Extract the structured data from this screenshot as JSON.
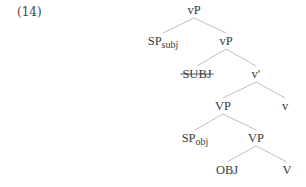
{
  "example_number": "(14)",
  "tree": {
    "nodes": [
      {
        "id": "vP_root",
        "label": "vP",
        "sub": ""
      },
      {
        "id": "SP_subj",
        "label": "SP",
        "sub": "subj"
      },
      {
        "id": "vP_2",
        "label": "vP",
        "sub": ""
      },
      {
        "id": "SUBJ",
        "label": "SUBJ",
        "sub": "",
        "struck": true
      },
      {
        "id": "v_bar",
        "label": "v′",
        "sub": ""
      },
      {
        "id": "VP_1",
        "label": "VP",
        "sub": ""
      },
      {
        "id": "v_head",
        "label": "v",
        "sub": ""
      },
      {
        "id": "SP_obj",
        "label": "SP",
        "sub": "obj"
      },
      {
        "id": "VP_2",
        "label": "VP",
        "sub": ""
      },
      {
        "id": "OBJ",
        "label": "OBJ",
        "sub": ""
      },
      {
        "id": "V_head",
        "label": "V",
        "sub": ""
      }
    ],
    "edges": [
      [
        "vP_root",
        "SP_subj"
      ],
      [
        "vP_root",
        "vP_2"
      ],
      [
        "vP_2",
        "SUBJ"
      ],
      [
        "vP_2",
        "v_bar"
      ],
      [
        "v_bar",
        "VP_1"
      ],
      [
        "v_bar",
        "v_head"
      ],
      [
        "VP_1",
        "SP_obj"
      ],
      [
        "VP_1",
        "VP_2"
      ],
      [
        "VP_2",
        "OBJ"
      ],
      [
        "VP_2",
        "V_head"
      ]
    ]
  }
}
